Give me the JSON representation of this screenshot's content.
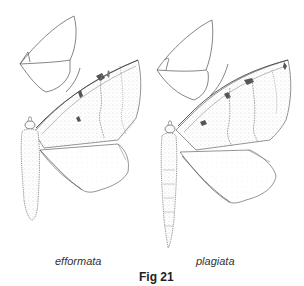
{
  "figure": {
    "caption": "Fig 21",
    "specimens": [
      {
        "name": "efformata"
      },
      {
        "name": "plagiata"
      }
    ]
  },
  "colors": {
    "line": "#555555",
    "stipple": "#9a9a9a",
    "dark_mark": "#4a4a4a",
    "text": "#333333"
  }
}
